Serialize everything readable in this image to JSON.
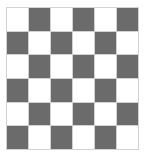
{
  "figure": {
    "background_color": "#ffffff",
    "canvas": {
      "width": 146,
      "height": 161
    }
  },
  "chart_data": {
    "type": "heatmap",
    "title": "",
    "subtitle": "",
    "xlabel": "",
    "ylabel": "",
    "rows": 6,
    "columns": 6,
    "categories": [
      "1",
      "2",
      "3",
      "4",
      "5",
      "6"
    ],
    "row_labels": [
      "1",
      "2",
      "3",
      "4",
      "5",
      "6"
    ],
    "column_labels": [
      "1",
      "2",
      "3",
      "4",
      "5",
      "6"
    ],
    "grid": true,
    "legend_position": "none",
    "value_names": {
      "0": "light",
      "1": "dark"
    },
    "colors": {
      "light": "#ffffff",
      "dark": "#6b6b6b",
      "gridline": "#d2d2d2",
      "background": "#ffffff"
    },
    "values": [
      [
        0,
        1,
        0,
        1,
        0,
        1
      ],
      [
        1,
        0,
        1,
        0,
        1,
        0
      ],
      [
        0,
        1,
        0,
        1,
        0,
        1
      ],
      [
        1,
        0,
        1,
        0,
        1,
        0
      ],
      [
        0,
        1,
        0,
        1,
        0,
        1
      ],
      [
        1,
        0,
        1,
        0,
        1,
        0
      ]
    ]
  }
}
